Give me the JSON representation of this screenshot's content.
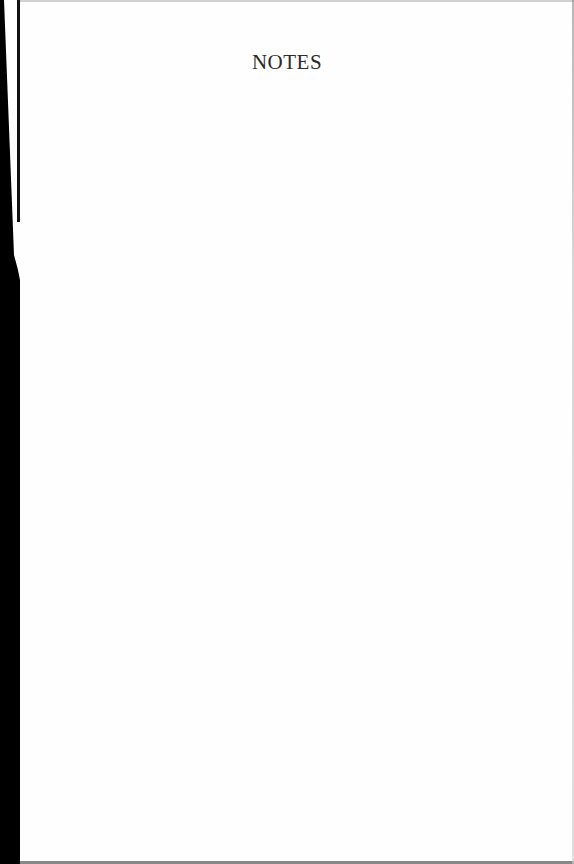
{
  "page": {
    "heading": "NOTES",
    "body_lines": []
  },
  "colors": {
    "paper": "#fefefe",
    "text": "#2b2b2b",
    "scan_border": "#000000"
  }
}
